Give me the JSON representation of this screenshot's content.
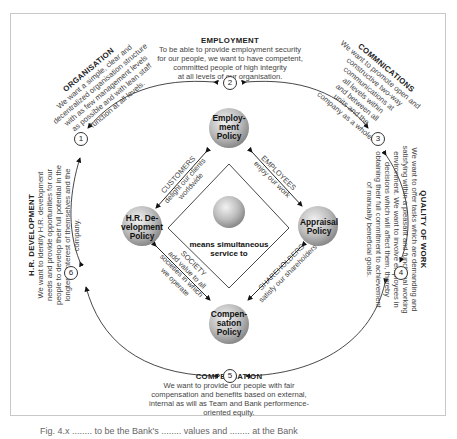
{
  "sections": {
    "employment": {
      "heading": "EMPLOYMENT",
      "lines": [
        "To be able to provide employment security",
        "for our people, we want to have competent,",
        "committed people of high integrity",
        "at all levels of our organisation."
      ]
    },
    "organisation": {
      "heading": "ORGANISATION",
      "lines": [
        "We want a simple, clear and",
        "decentralized organisation structure",
        "with as few management levels",
        "as possible and with lean staff",
        "function at all levels."
      ]
    },
    "communications": {
      "heading": "COMMNICATIONS",
      "lines": [
        "We want to promote open and",
        "constructive two-way",
        "communications at",
        "all levels within",
        "and between all",
        "units and the",
        "company as a whole."
      ]
    },
    "quality_of_work": {
      "heading": "QUALITY OF WORK",
      "lines": [
        "We want to offer tasks which are demanding and",
        "satisfying within a pleasant and functional working",
        "environment. We want to involve employees in",
        "decisions which will affect them, thereby",
        "obtaining their full commitment to achievement",
        "of manually beneficial goals."
      ]
    },
    "hr_development": {
      "heading": "H.R. DEVELOPMENT",
      "lines": [
        "We want to identify H.R. development",
        "needs and provide opportunities for our",
        "people to develop their full potential in the",
        "longterm interest of themselves and the",
        "company."
      ]
    },
    "compensation": {
      "heading": "COMPENSATION",
      "lines": [
        "We want to provide our people with fair",
        "compensation and benefits based on external,",
        "internal as will as Team and Bank performence-",
        "oriented equity."
      ]
    }
  },
  "policies": {
    "employment": [
      "Employ-",
      "ment",
      "Policy"
    ],
    "appraisal": [
      "Appraisal",
      "Policy"
    ],
    "compensation": [
      "Compen-",
      "sation",
      "Policy"
    ],
    "hr_development": [
      "H.R. De-",
      "velopment",
      "Policy"
    ]
  },
  "center": {
    "lines": [
      "means simultaneous",
      "service to"
    ]
  },
  "stakeholders": {
    "customers": {
      "title": "CUSTOMERS",
      "lines": [
        "delight our clients",
        "worldwide"
      ]
    },
    "employees": {
      "title": "EMPLOYEES",
      "lines": [
        "enjoy our work"
      ]
    },
    "shareholders": {
      "title": "SHAREHOLDERS",
      "lines": [
        "satisfy our shareholders"
      ]
    },
    "society": {
      "title": "SOCIETY",
      "lines": [
        "add value to all",
        "societies in which",
        "we operate"
      ]
    }
  },
  "numbers": [
    "1",
    "2",
    "3",
    "4",
    "5",
    "6"
  ],
  "caption": "Fig. 4.x ........ to be the Bank's ........ values and ........ at the Bank"
}
